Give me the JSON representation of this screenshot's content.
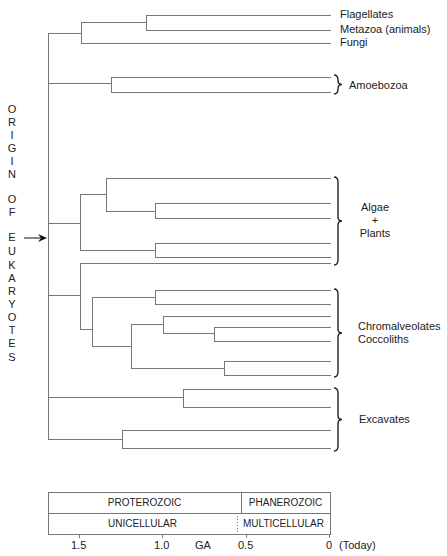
{
  "diagram": {
    "type": "phylogenetic-tree",
    "side_title": "ORIGIN OF EUKARYOTES",
    "side_title_letters": [
      {
        "ch": "O",
        "y": 103
      },
      {
        "ch": "R",
        "y": 116
      },
      {
        "ch": "I",
        "y": 129
      },
      {
        "ch": "G",
        "y": 142
      },
      {
        "ch": "I",
        "y": 155
      },
      {
        "ch": "N",
        "y": 168
      },
      {
        "ch": "O",
        "y": 193
      },
      {
        "ch": "F",
        "y": 206
      },
      {
        "ch": "E",
        "y": 231
      },
      {
        "ch": "U",
        "y": 245
      },
      {
        "ch": "K",
        "y": 259
      },
      {
        "ch": "A",
        "y": 272
      },
      {
        "ch": "R",
        "y": 285
      },
      {
        "ch": "Y",
        "y": 298
      },
      {
        "ch": "O",
        "y": 311
      },
      {
        "ch": "T",
        "y": 324
      },
      {
        "ch": "E",
        "y": 337
      },
      {
        "ch": "S",
        "y": 351
      }
    ],
    "origin_arrow": {
      "x1": 24,
      "x2": 47,
      "y": 238
    },
    "line_color": "#777777",
    "tip_x": 331,
    "segments": [
      [
        48,
        33,
        48,
        439
      ],
      [
        48,
        33,
        81,
        33
      ],
      [
        81,
        22,
        81,
        43
      ],
      [
        81,
        22,
        146,
        22
      ],
      [
        146,
        15,
        146,
        30
      ],
      [
        146,
        15,
        331,
        15
      ],
      [
        146,
        30,
        331,
        30
      ],
      [
        81,
        43,
        331,
        43
      ],
      [
        48,
        83,
        111,
        83
      ],
      [
        111,
        77,
        111,
        92
      ],
      [
        111,
        77,
        331,
        77
      ],
      [
        111,
        92,
        331,
        92
      ],
      [
        48,
        223,
        80,
        223
      ],
      [
        80,
        194,
        80,
        250
      ],
      [
        80,
        194,
        106,
        194
      ],
      [
        106,
        178,
        106,
        211
      ],
      [
        106,
        178,
        331,
        178
      ],
      [
        106,
        211,
        155,
        211
      ],
      [
        155,
        203,
        155,
        218
      ],
      [
        155,
        203,
        331,
        203
      ],
      [
        155,
        218,
        331,
        218
      ],
      [
        80,
        250,
        155,
        250
      ],
      [
        155,
        243,
        155,
        257
      ],
      [
        155,
        243,
        331,
        243
      ],
      [
        155,
        257,
        331,
        257
      ],
      [
        48,
        295,
        80,
        295
      ],
      [
        80,
        263,
        80,
        329
      ],
      [
        80,
        263,
        331,
        263
      ],
      [
        80,
        329,
        92,
        329
      ],
      [
        92,
        297,
        92,
        346
      ],
      [
        92,
        297,
        155,
        297
      ],
      [
        155,
        290,
        155,
        304
      ],
      [
        155,
        290,
        331,
        290
      ],
      [
        155,
        304,
        331,
        304
      ],
      [
        92,
        346,
        131,
        346
      ],
      [
        131,
        324,
        131,
        368
      ],
      [
        131,
        324,
        163,
        324
      ],
      [
        163,
        316,
        163,
        333
      ],
      [
        163,
        316,
        331,
        316
      ],
      [
        163,
        333,
        214,
        333
      ],
      [
        214,
        327,
        214,
        341
      ],
      [
        214,
        327,
        331,
        327
      ],
      [
        214,
        341,
        331,
        341
      ],
      [
        131,
        368,
        224,
        368
      ],
      [
        224,
        361,
        224,
        375
      ],
      [
        224,
        361,
        331,
        361
      ],
      [
        224,
        375,
        331,
        375
      ],
      [
        48,
        397,
        183,
        397
      ],
      [
        183,
        389,
        183,
        407
      ],
      [
        183,
        389,
        331,
        389
      ],
      [
        183,
        407,
        331,
        407
      ],
      [
        48,
        439,
        122,
        439
      ],
      [
        122,
        430,
        122,
        448
      ],
      [
        122,
        430,
        331,
        430
      ],
      [
        122,
        448,
        331,
        448
      ]
    ],
    "tips": [
      {
        "label": "Flagellates",
        "y": 15
      },
      {
        "label": "Metazoa (animals)",
        "y": 30
      },
      {
        "label": "Fungi",
        "y": 43
      }
    ],
    "groups": [
      {
        "id": "amoebozoa",
        "lines": [
          "Amoebozoa"
        ],
        "brace_top": 75,
        "brace_bottom": 94,
        "label_x": 349,
        "label_y": 79,
        "align": "left"
      },
      {
        "id": "algae-plants",
        "lines": [
          "Algae",
          "+",
          "Plants"
        ],
        "brace_top": 177,
        "brace_bottom": 265,
        "label_x": 355,
        "label_y": 201,
        "align": "center",
        "width": 40
      },
      {
        "id": "chromalveolates",
        "lines": [
          "Chromalveolates",
          "Coccoliths"
        ],
        "brace_top": 289,
        "brace_bottom": 377,
        "label_x": 358,
        "label_y": 320,
        "align": "left"
      },
      {
        "id": "excavates",
        "lines": [
          "Excavates"
        ],
        "brace_top": 388,
        "brace_bottom": 451,
        "label_x": 359,
        "label_y": 413,
        "align": "left"
      }
    ]
  },
  "timeline": {
    "box": {
      "x": 48,
      "y": 492,
      "w": 282,
      "row_h": 21
    },
    "rows": [
      {
        "cells": [
          {
            "label": "PROTEROZOIC",
            "x0": 48,
            "x1": 241
          },
          {
            "label": "PHANEROZOIC",
            "x0": 241,
            "x1": 330
          }
        ],
        "divider": "solid",
        "divider_x": 241
      },
      {
        "cells": [
          {
            "label": "UNICELLULAR",
            "x0": 48,
            "x1": 237
          },
          {
            "label": "MULTICELLULAR",
            "x0": 237,
            "x1": 330
          }
        ],
        "divider": "dotted",
        "divider_x": 237
      }
    ],
    "axis_unit": "GA",
    "axis_unit_x": 203,
    "ticks": [
      {
        "label": "1.5",
        "x": 79
      },
      {
        "label": "1.0",
        "x": 162
      },
      {
        "label": "0.5",
        "x": 246
      },
      {
        "label": "0",
        "x": 329
      }
    ],
    "today_label": "(Today)",
    "label_y": 539
  }
}
